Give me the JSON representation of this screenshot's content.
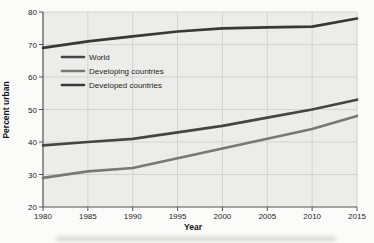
{
  "chart_data": {
    "type": "line",
    "title": "",
    "xlabel": "Year",
    "ylabel": "Percent urban",
    "x": [
      1980,
      1985,
      1990,
      1995,
      2000,
      2005,
      2010,
      2015
    ],
    "xlim": [
      1980,
      2015
    ],
    "ylim": [
      20,
      80
    ],
    "ytick_step": 10,
    "grid": true,
    "legend_position": "upper-left-inside",
    "series": [
      {
        "name": "World",
        "color": "#454543",
        "values": [
          39,
          40,
          41,
          43,
          45,
          47.5,
          50,
          53
        ]
      },
      {
        "name": "Developing countries",
        "color": "#787876",
        "values": [
          29,
          31,
          32,
          35,
          38,
          41,
          44,
          48
        ]
      },
      {
        "name": "Developed countries",
        "color": "#39393七",
        "values": [
          69,
          71,
          72.5,
          74,
          75,
          75.3,
          75.5,
          78
        ]
      }
    ]
  },
  "colors": {
    "plot_bg": "#ececea",
    "grid": "#d3d3d1",
    "axis": "#55534f",
    "tick_text": "#1d1d1b",
    "series_world": "#454543",
    "series_developing": "#787876",
    "series_developed": "#383836"
  }
}
